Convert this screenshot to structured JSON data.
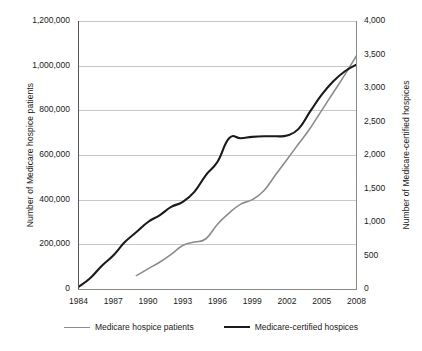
{
  "chart_data": {
    "type": "line",
    "title": "",
    "xlabel": "",
    "grid": "horizontal",
    "legend_position": "bottom",
    "x": [
      1984,
      1985,
      1986,
      1987,
      1988,
      1989,
      1990,
      1991,
      1992,
      1993,
      1994,
      1995,
      1996,
      1997,
      1998,
      1999,
      2000,
      2001,
      2002,
      2003,
      2004,
      2005,
      2006,
      2007,
      2008
    ],
    "xlim": [
      1984,
      2008
    ],
    "xticks": [
      "1984",
      "1987",
      "1990",
      "1993",
      "1996",
      "1999",
      "2002",
      "2005",
      "2008"
    ],
    "axes": {
      "left": {
        "label": "Number of Medicare hospice patients",
        "lim": [
          0,
          1200000
        ],
        "ticks": [
          "0",
          "200,000",
          "400,000",
          "600,000",
          "800,000",
          "1,000,000",
          "1,200,000"
        ],
        "tick_values": [
          0,
          200000,
          400000,
          600000,
          800000,
          1000000,
          1200000
        ]
      },
      "right": {
        "label": "Number of Medicare-certified hospices",
        "lim": [
          0,
          4000
        ],
        "ticks": [
          "0",
          "500",
          "1,000",
          "1,500",
          "2,000",
          "2,500",
          "3,000",
          "3,500",
          "4,000"
        ],
        "tick_values": [
          0,
          500,
          1000,
          1500,
          2000,
          2500,
          3000,
          3500,
          4000
        ]
      }
    },
    "series": [
      {
        "name": "Medicare hospice patients",
        "axis": "left",
        "color": "#8c8c8c",
        "x": [
          1989,
          1990,
          1991,
          1992,
          1993,
          1994,
          1995,
          1996,
          1997,
          1998,
          1999,
          2000,
          2001,
          2002,
          2003,
          2004,
          2005,
          2006,
          2007,
          2008
        ],
        "values": [
          60000,
          90000,
          120000,
          155000,
          195000,
          210000,
          225000,
          290000,
          340000,
          380000,
          400000,
          440000,
          510000,
          580000,
          650000,
          720000,
          800000,
          880000,
          960000,
          1045000
        ]
      },
      {
        "name": "Medicare-certified hospices",
        "axis": "right",
        "color": "#1a1a1a",
        "x": [
          1984,
          1985,
          1986,
          1987,
          1988,
          1989,
          1990,
          1991,
          1992,
          1993,
          1994,
          1995,
          1996,
          1997,
          1998,
          1999,
          2000,
          2001,
          2002,
          2003,
          2004,
          2005,
          2006,
          2007,
          2008
        ],
        "values": [
          31,
          160,
          345,
          500,
          700,
          850,
          1000,
          1100,
          1225,
          1300,
          1450,
          1700,
          1900,
          2250,
          2250,
          2270,
          2280,
          2280,
          2290,
          2390,
          2650,
          2900,
          3100,
          3250,
          3350
        ]
      }
    ],
    "legend": [
      {
        "label": "Medicare hospice patients",
        "color": "#8c8c8c",
        "style": "thin"
      },
      {
        "label": "Medicare-certified hospices",
        "color": "#1a1a1a",
        "style": "thick"
      }
    ]
  }
}
